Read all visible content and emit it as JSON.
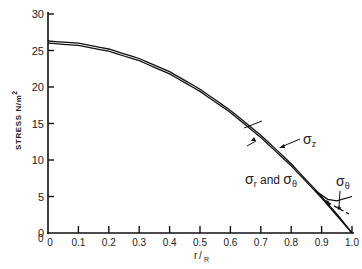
{
  "chart_data": {
    "type": "line",
    "title": "",
    "xlabel": "r/R",
    "ylabel": "STRESS N/m²",
    "xlim": [
      0,
      1.0
    ],
    "ylim": [
      0,
      30
    ],
    "x_ticks": [
      "0",
      "0.1",
      "0.2",
      "0.3",
      "0.4",
      "0.5",
      "0.6",
      "0.7",
      "0.8",
      "0.9",
      "1.0"
    ],
    "y_ticks": [
      "0",
      "5",
      "10",
      "15",
      "20",
      "25",
      "30"
    ],
    "grid": false,
    "legend": "none (inline annotations)",
    "x": [
      0,
      0.1,
      0.2,
      0.3,
      0.4,
      0.5,
      0.6,
      0.7,
      0.8,
      0.9,
      0.95,
      1.0
    ],
    "series": [
      {
        "name": "σz",
        "values": [
          26.3,
          26.0,
          25.2,
          23.9,
          22.1,
          19.7,
          16.8,
          13.4,
          9.5,
          5.0,
          2.6,
          0
        ]
      },
      {
        "name": "σr and σθ",
        "values": [
          26.0,
          25.7,
          24.9,
          23.6,
          21.8,
          19.4,
          16.5,
          13.1,
          9.2,
          4.8,
          2.4,
          0
        ]
      },
      {
        "name": "σθ (edge branch)",
        "x": [
          0.88,
          0.92,
          0.95,
          1.0
        ],
        "values": [
          5.8,
          4.6,
          4.4,
          5.0
        ]
      },
      {
        "name": "σθ (dashed)",
        "x": [
          0.92,
          0.95,
          0.99
        ],
        "values": [
          4.2,
          3.5,
          2.6
        ],
        "style": "dashed"
      }
    ],
    "annotations": [
      "σr and σθ",
      "σz",
      "σθ"
    ]
  },
  "labels": {
    "ylabel_text": "STRESS N/m",
    "ylabel_sup": "2",
    "xlabel_r": "r",
    "xlabel_R": "R",
    "origin_extra": "0",
    "ann_sr": "σ",
    "ann_sr_sub": "r",
    "ann_and": " and ",
    "ann_st": "σ",
    "ann_st_sub": "θ",
    "ann_sz": "σ",
    "ann_sz_sub": "z",
    "ann_edge": "σ",
    "ann_edge_sub": "θ"
  }
}
